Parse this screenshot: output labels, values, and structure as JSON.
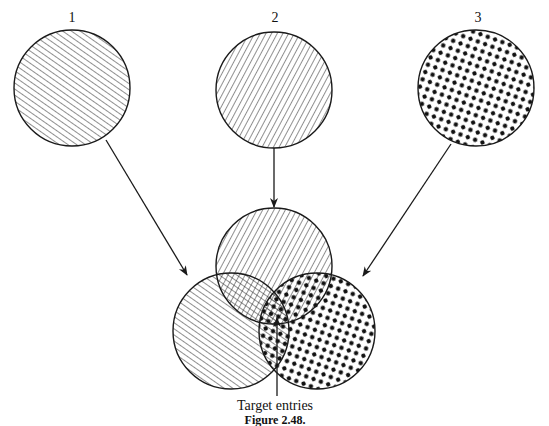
{
  "diagram": {
    "type": "venn-diagram",
    "sets": [
      {
        "id": "1",
        "label": "1",
        "pattern": "forward-diagonal-hatch",
        "source_center": [
          72,
          88
        ],
        "venn_center": [
          231,
          331
        ],
        "radius": 58
      },
      {
        "id": "2",
        "label": "2",
        "pattern": "backward-diagonal-hatch",
        "source_center": [
          274,
          90
        ],
        "venn_center": [
          274,
          266
        ],
        "radius": 58
      },
      {
        "id": "3",
        "label": "3",
        "pattern": "dots",
        "source_center": [
          476,
          88
        ],
        "venn_center": [
          317,
          331
        ],
        "radius": 58
      }
    ],
    "arrows": [
      {
        "from": "set-1",
        "to": "venn-set-1"
      },
      {
        "from": "set-2",
        "to": "venn-set-2"
      },
      {
        "from": "set-3",
        "to": "venn-set-3"
      }
    ],
    "annotation": {
      "text": "Target entries",
      "points_to": "intersection of sets 1, 2 and 3"
    },
    "caption": "Figure 2.48.",
    "colors": {
      "ink": "#1a1a1a",
      "background": "#ffffff"
    }
  }
}
